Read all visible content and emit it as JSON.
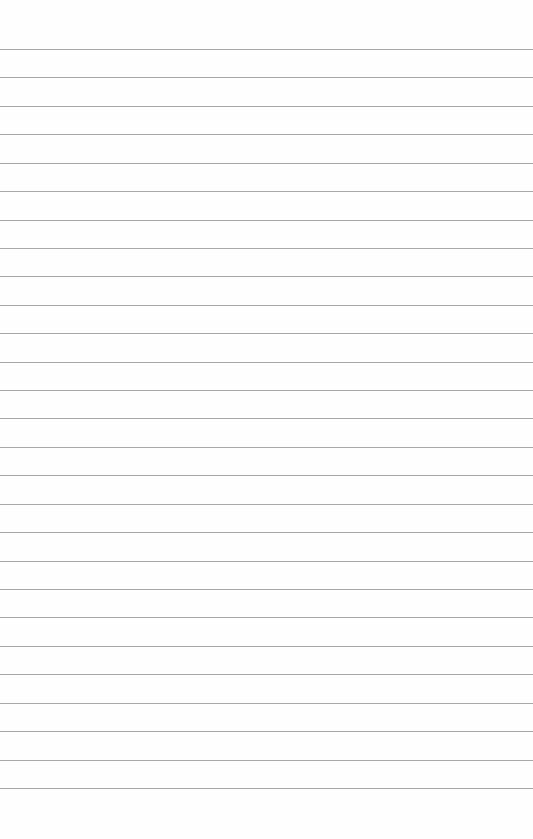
{
  "page": {
    "type": "lined-paper",
    "background_color": "#fefefe",
    "line_color": "#9a9a9a",
    "line_count": 27,
    "first_line_y": 49,
    "line_spacing": 28.42
  }
}
